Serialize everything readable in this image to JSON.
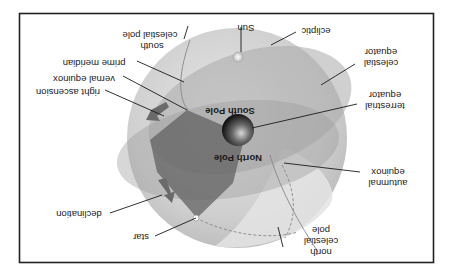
{
  "diagram": {
    "orientation": "rotated 180 degrees",
    "colors": {
      "frame": "#222222",
      "sphere": "#c9c9c9",
      "ecliptic_plane": "#a8a8a8",
      "celestial_equator_plane": "#b8b8b8",
      "right_ascension_wedge": "#6e6e6e",
      "earth": "#2a2a2a",
      "arrow": "#6a6a6a",
      "star": "#ffffff",
      "sun": "#e0e0e0"
    },
    "labels": {
      "sun": "Sun",
      "ecliptic": "ecliptic",
      "celestial_equator_1": "celestial",
      "celestial_equator_2": "equator",
      "terrestrial_equator_1": "terrestrial",
      "terrestrial_equator_2": "equator",
      "autumnal_equinox_1": "autumnal",
      "autumnal_equinox_2": "equinox",
      "north_celestial_pole_1": "north",
      "north_celestial_pole_2": "celestial",
      "north_celestial_pole_3": "pole",
      "star": "star",
      "declination": "declination",
      "right_ascension": "right ascension",
      "vernal_equinox": "vernal equinox",
      "prime_meridian": "prime meridian",
      "south_celestial_pole_1": "south",
      "south_celestial_pole_2": "celestial pole",
      "south_pole": "South Pole",
      "north_pole": "North Pole"
    }
  }
}
